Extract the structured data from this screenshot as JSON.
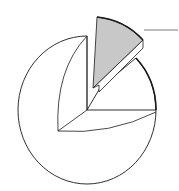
{
  "diagram": {
    "type": "exploded-pie-line-art",
    "colors": {
      "background": "#ffffff",
      "stroke": "#1a1a1a",
      "highlight_fill": "#c8c8c8",
      "leader": "#6b6b6b"
    },
    "center": [
      87,
      110
    ],
    "radius": 69,
    "highlighted_slice": {
      "fill": "#c8c8c8",
      "exploded": true
    },
    "leader_line": {
      "from": [
        143,
        30
      ],
      "to": [
        178,
        30
      ]
    }
  }
}
